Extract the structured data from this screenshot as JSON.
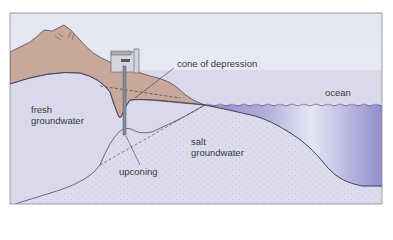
{
  "diagram": {
    "type": "cross-section",
    "labels": {
      "cone": "cone of depression",
      "ocean": "ocean",
      "fresh_line1": "fresh",
      "fresh_line2": "groundwater",
      "salt_line1": "salt",
      "salt_line2": "groundwater",
      "upconing": "upconing"
    },
    "colors": {
      "sky": "#e6e9f4",
      "land": "#c9a79b",
      "land_outline": "#3a3a4a",
      "fresh_groundwater": "#d8d8ea",
      "salt_groundwater": "#dcdceb",
      "ocean_light": "#e4e4f4",
      "ocean_dark": "#8e8ccb",
      "well": "#7f8e9c",
      "building": "#d4d6dc"
    },
    "elements": [
      "mountain",
      "unsaturated zone",
      "pumping well",
      "pump house",
      "water table",
      "cone of depression",
      "fresh groundwater",
      "salt groundwater",
      "freshwater-saltwater interface",
      "ocean",
      "sea floor"
    ]
  }
}
